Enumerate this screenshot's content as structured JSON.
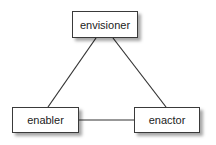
{
  "diagram": {
    "type": "triangle-relationship",
    "nodes": [
      {
        "id": "envisioner",
        "label": "envisioner",
        "position": "top"
      },
      {
        "id": "enabler",
        "label": "enabler",
        "position": "bottom-left"
      },
      {
        "id": "enactor",
        "label": "enactor",
        "position": "bottom-right"
      }
    ],
    "edges": [
      {
        "from": "envisioner",
        "to": "enabler"
      },
      {
        "from": "envisioner",
        "to": "enactor"
      },
      {
        "from": "enabler",
        "to": "enactor"
      }
    ],
    "colors": {
      "border": "#3a3a3a",
      "line": "#333333",
      "text": "#222222",
      "background": "#ffffff"
    }
  }
}
